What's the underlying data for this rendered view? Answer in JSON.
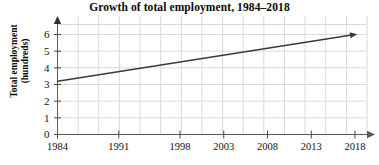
{
  "chart_data": {
    "type": "line",
    "title": "Growth of total employment, 1984–2018",
    "xlabel": "",
    "ylabel": "Total employment (hundreds)",
    "ylabel_line1": "Total employment",
    "ylabel_line2": "(hundreds)",
    "x_tick_labels": [
      "1984",
      "1991",
      "1998",
      "2003",
      "2008",
      "2013",
      "2018"
    ],
    "x_tick_values": [
      1984,
      1991,
      1998,
      2003,
      2008,
      2013,
      2018
    ],
    "y_tick_labels": [
      "0",
      "1",
      "2",
      "3",
      "4",
      "5",
      "6"
    ],
    "y_tick_values": [
      0,
      1,
      2,
      3,
      4,
      5,
      6
    ],
    "xlim": [
      1984,
      2018
    ],
    "ylim": [
      0,
      6.5
    ],
    "grid": true,
    "legend": "none",
    "series": [
      {
        "name": "Total employment",
        "x": [
          1984,
          2018
        ],
        "values": [
          3.2,
          6.0
        ],
        "arrow_end": true,
        "color": "#3a3a3a"
      }
    ],
    "colors": {
      "line": "#3a3a3a",
      "axis": "#4a4a4a",
      "grid": "#d9d9d9",
      "text": "#0a0a0a",
      "background": "#ffffff"
    }
  }
}
